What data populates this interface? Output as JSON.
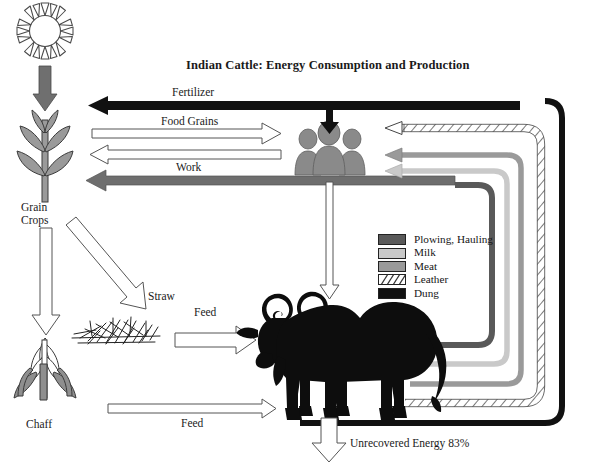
{
  "title": "Indian Cattle: Energy Consumption and Production",
  "nodes": {
    "sun": "sun-icon",
    "grain_crops": "Grain\nCrops",
    "grain_crops_line1": "Grain",
    "grain_crops_line2": "Crops",
    "chaff": "Chaff",
    "straw": "Straw",
    "people": "people-icon",
    "cow": "cow-icon"
  },
  "flows": {
    "fertilizer": "Fertilizer",
    "food_grains": "Food Grains",
    "work": "Work",
    "feed_straw": "Feed",
    "feed_chaff": "Feed",
    "unrecovered": "Unrecovered Energy 83%"
  },
  "legend": {
    "items": [
      {
        "label": "Plowing, Hauling",
        "color": "#595959",
        "pattern": "solid"
      },
      {
        "label": "Milk",
        "color": "#c9c9c9",
        "pattern": "solid"
      },
      {
        "label": "Meat",
        "color": "#9a9a9a",
        "pattern": "solid"
      },
      {
        "label": "Leather",
        "color": "#ffffff",
        "pattern": "hatch"
      },
      {
        "label": "Dung",
        "color": "#111111",
        "pattern": "solid"
      }
    ]
  },
  "colors": {
    "black": "#111111",
    "dark_gray": "#595959",
    "mid_gray": "#8f8f8f",
    "meat_gray": "#9a9a9a",
    "light_gray": "#c9c9c9",
    "plant_gray": "#8a8a8a",
    "outline": "#3a3a3a",
    "white": "#ffffff"
  }
}
